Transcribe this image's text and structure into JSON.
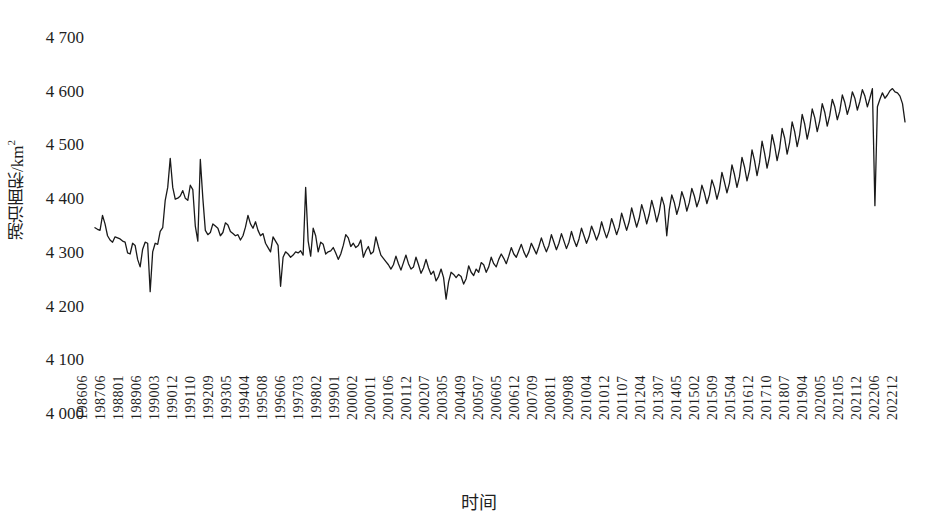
{
  "chart_data": {
    "type": "line",
    "title": "",
    "xlabel": "时间",
    "ylabel": "湖泊面积/km²",
    "ylabel_main": "湖泊面积/km",
    "ylabel_exp": "2",
    "ylim": [
      4000,
      4700
    ],
    "yticks": [
      4000,
      4100,
      4200,
      4300,
      4400,
      4500,
      4600,
      4700
    ],
    "ytick_labels": [
      "4 000",
      "4 100",
      "4 200",
      "4 300",
      "4 400",
      "4 500",
      "4 600",
      "4 700"
    ],
    "grid": false,
    "legend": null,
    "line_color": "#1a1a1a",
    "line_width": 1.3,
    "xtick_labels": [
      "198606",
      "198706",
      "198801",
      "198906",
      "199003",
      "199012",
      "199110",
      "199209",
      "199305",
      "199404",
      "199508",
      "199606",
      "199703",
      "199802",
      "199901",
      "200002",
      "200011",
      "200106",
      "200112",
      "200207",
      "200305",
      "200409",
      "200507",
      "200605",
      "200612",
      "200709",
      "200811",
      "200908",
      "201004",
      "201012",
      "201107",
      "201204",
      "201307",
      "201405",
      "201502",
      "201509",
      "201504",
      "201612",
      "201710",
      "201807",
      "201904",
      "202005",
      "202105",
      "202112",
      "202206",
      "202212"
    ],
    "series": [
      {
        "name": "湖泊面积",
        "values": [
          4345,
          4342,
          4340,
          4368,
          4352,
          4330,
          4322,
          4318,
          4328,
          4326,
          4324,
          4320,
          4318,
          4298,
          4296,
          4316,
          4312,
          4286,
          4272,
          4305,
          4318,
          4316,
          4226,
          4300,
          4316,
          4314,
          4338,
          4345,
          4396,
          4420,
          4474,
          4420,
          4398,
          4400,
          4404,
          4414,
          4400,
          4396,
          4424,
          4416,
          4348,
          4320,
          4472,
          4400,
          4340,
          4332,
          4336,
          4352,
          4348,
          4344,
          4330,
          4336,
          4354,
          4350,
          4338,
          4334,
          4330,
          4332,
          4322,
          4330,
          4346,
          4368,
          4352,
          4344,
          4356,
          4340,
          4330,
          4334,
          4316,
          4308,
          4300,
          4328,
          4320,
          4312,
          4236,
          4290,
          4300,
          4296,
          4290,
          4294,
          4300,
          4298,
          4302,
          4294,
          4420,
          4320,
          4292,
          4344,
          4330,
          4300,
          4318,
          4314,
          4296,
          4300,
          4302,
          4308,
          4298,
          4286,
          4296,
          4312,
          4332,
          4326,
          4310,
          4316,
          4308,
          4312,
          4322,
          4290,
          4302,
          4310,
          4296,
          4300,
          4328,
          4310,
          4294,
          4288,
          4282,
          4276,
          4268,
          4276,
          4292,
          4278,
          4266,
          4280,
          4294,
          4278,
          4268,
          4272,
          4290,
          4276,
          4260,
          4270,
          4286,
          4270,
          4258,
          4264,
          4246,
          4254,
          4268,
          4252,
          4212,
          4244,
          4262,
          4258,
          4252,
          4258,
          4254,
          4240,
          4250,
          4274,
          4262,
          4256,
          4268,
          4262,
          4280,
          4276,
          4262,
          4272,
          4290,
          4278,
          4272,
          4286,
          4296,
          4288,
          4278,
          4292,
          4308,
          4296,
          4290,
          4302,
          4314,
          4300,
          4290,
          4300,
          4316,
          4306,
          4296,
          4310,
          4326,
          4312,
          4300,
          4312,
          4332,
          4318,
          4304,
          4316,
          4334,
          4320,
          4306,
          4318,
          4338,
          4322,
          4310,
          4324,
          4344,
          4330,
          4316,
          4328,
          4348,
          4336,
          4322,
          4334,
          4356,
          4340,
          4326,
          4340,
          4362,
          4348,
          4332,
          4346,
          4372,
          4356,
          4340,
          4356,
          4382,
          4364,
          4346,
          4362,
          4388,
          4372,
          4352,
          4370,
          4396,
          4378,
          4356,
          4374,
          4402,
          4386,
          4330,
          4378,
          4406,
          4392,
          4370,
          4386,
          4412,
          4398,
          4376,
          4392,
          4418,
          4404,
          4384,
          4398,
          4424,
          4410,
          4390,
          4406,
          4434,
          4420,
          4398,
          4416,
          4448,
          4430,
          4410,
          4428,
          4462,
          4444,
          4420,
          4440,
          4476,
          4458,
          4432,
          4452,
          4490,
          4470,
          4442,
          4466,
          4506,
          4484,
          4456,
          4478,
          4518,
          4498,
          4470,
          4492,
          4530,
          4512,
          4482,
          4504,
          4542,
          4524,
          4496,
          4518,
          4556,
          4538,
          4510,
          4532,
          4566,
          4550,
          4524,
          4544,
          4576,
          4560,
          4534,
          4554,
          4584,
          4570,
          4546,
          4562,
          4592,
          4578,
          4556,
          4572,
          4598,
          4586,
          4564,
          4580,
          4602,
          4590,
          4570,
          4586,
          4604,
          4386,
          4570,
          4584,
          4596,
          4586,
          4592,
          4600,
          4604,
          4598,
          4596,
          4590,
          4576,
          4542
        ]
      }
    ],
    "annotations": [
      {
        "label": "1990 peak",
        "value": 4474
      },
      {
        "label": "1991 peak",
        "value": 4472
      },
      {
        "label": "1997 peak",
        "value": 4420
      },
      {
        "label": "1996 trough",
        "value": 4226
      },
      {
        "label": "2004 minimum",
        "value": 4212
      },
      {
        "label": "2021 sharp dip",
        "value": 4386
      },
      {
        "label": "2022 maximum",
        "value": 4604
      },
      {
        "label": "series start 198606",
        "value": 4345
      },
      {
        "label": "series end 202212",
        "value": 4542
      }
    ]
  },
  "axes": {
    "plot_left_px": 95,
    "plot_right_px": 905,
    "plot_top_px": 37,
    "plot_bottom_px": 413
  },
  "footer": {
    "sliver_text": ""
  }
}
